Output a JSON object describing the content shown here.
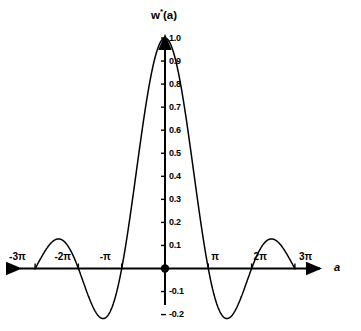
{
  "chart_data": {
    "type": "line",
    "title": "w*(a)",
    "title_base": "w",
    "title_superscript": "*",
    "title_arg": "(a)",
    "xlabel": "a",
    "ylabel": "",
    "xlim": [
      -9.4248,
      9.4248
    ],
    "ylim": [
      -0.25,
      1.05
    ],
    "grid": false,
    "legend": null,
    "function": "sin(a)/a",
    "x_tick_labels": [
      "-3π",
      "-2π",
      "-π",
      "π",
      "2π",
      "3π"
    ],
    "x_tick_values": [
      -9.4248,
      -6.2832,
      -3.1416,
      3.1416,
      6.2832,
      9.4248
    ],
    "y_tick_labels": [
      "1.0",
      "0.9",
      "0.8",
      "0.7",
      "0.6",
      "0.5",
      "0.4",
      "0.3",
      "0.2",
      "0.1",
      "-0.1",
      "-0.2"
    ],
    "y_tick_values": [
      1.0,
      0.9,
      0.8,
      0.7,
      0.6,
      0.5,
      0.4,
      0.3,
      0.2,
      0.1,
      -0.1,
      -0.2
    ],
    "origin_marker": true,
    "x": [
      -9.4248,
      -9.1106,
      -8.7965,
      -8.4823,
      -8.1681,
      -7.854,
      -7.5398,
      -7.2257,
      -6.9115,
      -6.5973,
      -6.2832,
      -5.969,
      -5.6549,
      -5.3407,
      -5.0265,
      -4.7124,
      -4.3982,
      -4.084,
      -3.7699,
      -3.4557,
      -3.1416,
      -2.8274,
      -2.5133,
      -2.1991,
      -1.885,
      -1.5708,
      -1.2566,
      -0.9425,
      -0.6283,
      -0.3142,
      0.0,
      0.3142,
      0.6283,
      0.9425,
      1.2566,
      1.5708,
      1.885,
      2.1991,
      2.5133,
      2.8274,
      3.1416,
      3.4557,
      3.7699,
      4.084,
      4.3982,
      4.7124,
      5.0265,
      5.3407,
      5.6549,
      5.969,
      6.2832,
      6.5973,
      6.9115,
      7.2257,
      7.5398,
      7.854,
      8.1681,
      8.4823,
      8.7965,
      9.1106,
      9.4248
    ],
    "y": [
      0.0,
      0.0335,
      0.0581,
      0.0715,
      0.0726,
      0.0614,
      0.0396,
      0.0105,
      -0.0215,
      -0.0511,
      -0.0733,
      -0.0845,
      -0.0827,
      -0.0684,
      -0.0437,
      -0.0124,
      0.0205,
      0.0499,
      0.0714,
      0.0821,
      0.0,
      -0.1041,
      -0.2012,
      -0.2837,
      -0.3455,
      -0.382,
      0.4444,
      0.5924,
      0.7407,
      0.8656,
      1.0,
      0.8656,
      0.7407,
      0.5924,
      0.4444,
      -0.382,
      -0.3455,
      -0.2837,
      -0.2012,
      -0.1041,
      0.0,
      0.0821,
      0.0714,
      0.0499,
      0.0205,
      -0.0124,
      -0.0437,
      -0.0684,
      -0.0827,
      -0.0845,
      -0.0733,
      -0.0511,
      -0.0215,
      0.0105,
      0.0396,
      0.0614,
      0.0726,
      0.0715,
      0.0581,
      0.0335,
      0.0
    ],
    "main_lobe_peak": 1.0,
    "side_lobe_extrema": [
      -0.2172,
      0.1284,
      -0.0913,
      0.0727
    ],
    "colors": {
      "curve": "#000000",
      "axis": "#000000",
      "background": "#ffffff"
    }
  }
}
